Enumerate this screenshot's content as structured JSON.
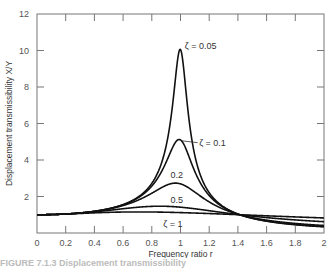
{
  "chart_data": {
    "type": "line",
    "title": "",
    "xlabel": "Frequency ratio r",
    "ylabel": "Displacement transmissibility X/Y",
    "xlim": [
      0,
      2
    ],
    "ylim": [
      0,
      12
    ],
    "xticks": [
      0,
      0.2,
      0.4,
      0.6,
      0.8,
      1,
      1.2,
      1.4,
      1.6,
      1.8,
      2
    ],
    "xtick_labels": [
      "0",
      "0.2",
      "0.4",
      "0.6",
      "0.8",
      "1",
      "1.2",
      "1.4",
      "1.6",
      "1.8",
      "2"
    ],
    "yticks": [
      2,
      4,
      6,
      8,
      10,
      12
    ],
    "ytick_labels": [
      "2",
      "4",
      "6",
      "8",
      "10",
      "12"
    ],
    "grid": false,
    "formula": "X/Y = sqrt((1+(2*zeta*r)^2)/((1-r^2)^2+(2*zeta*r)^2))",
    "series": [
      {
        "name": "ζ = 0.05",
        "zeta": 0.05,
        "label": "ζ = 0.05",
        "peak": 10.05
      },
      {
        "name": "ζ = 0.1",
        "zeta": 0.1,
        "label": "ζ = 0.1",
        "peak": 5.1
      },
      {
        "name": "ζ = 0.2",
        "zeta": 0.2,
        "label": "0.2",
        "peak": 2.7
      },
      {
        "name": "ζ = 0.5",
        "zeta": 0.5,
        "label": "0.5",
        "peak": 1.45
      },
      {
        "name": "ζ = 1",
        "zeta": 1.0,
        "label": "ζ = 1",
        "peak": 1.15
      }
    ],
    "annotations": [
      "ζ = 0.05",
      "ζ = 0.1",
      "0.2",
      "0.5",
      "ζ = 1"
    ]
  },
  "caption": "FIGURE 7.1.3  Displacement transmissibility"
}
